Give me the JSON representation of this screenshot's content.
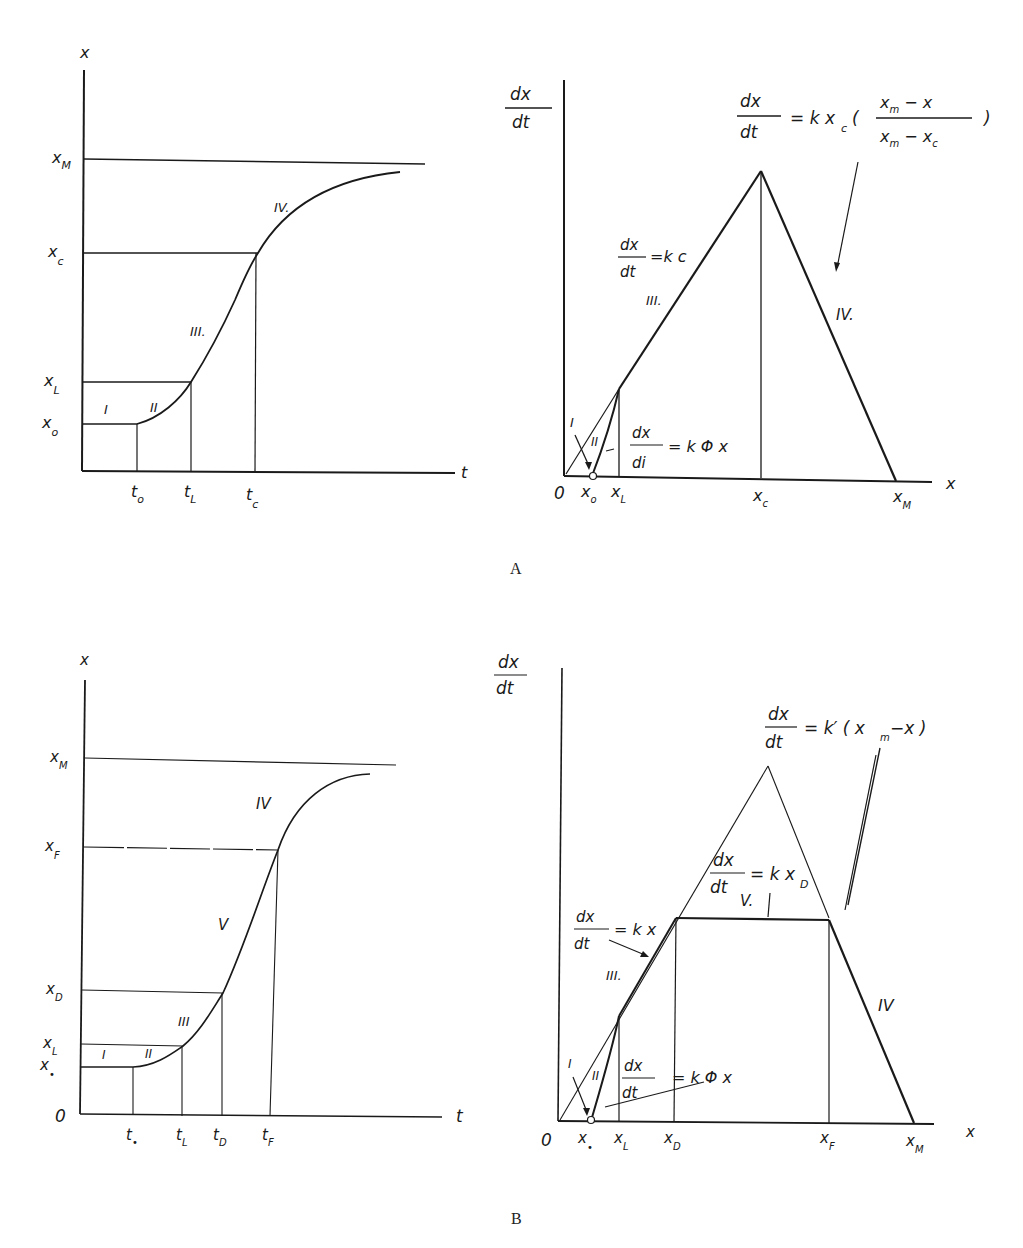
{
  "panels": {
    "A": {
      "caption": "A",
      "left": {
        "y_axis": "x",
        "x_axis": "t",
        "y_ticks": [
          "x_M",
          "x_c",
          "x_L",
          "x_o"
        ],
        "x_ticks": [
          "t_o",
          "t_L",
          "t_c"
        ],
        "phase_labels": [
          "I",
          "II",
          "III.",
          "IV."
        ]
      },
      "right": {
        "y_axis_num": "dx",
        "y_axis_den": "dt",
        "x_axis": "x",
        "x_ticks": [
          "0",
          "x_o",
          "x_L",
          "x_c",
          "x_M"
        ],
        "eq_top": {
          "num": "dx",
          "den": "dt",
          "rhs": "= k x_c (",
          "frac_num": "x_m − x",
          "frac_den": "x_m − x_c",
          "close": ")"
        },
        "eq_III": {
          "num": "dx",
          "den": "dt",
          "rhs": "=k c"
        },
        "eq_II": {
          "num": "dx",
          "den": "di",
          "rhs": "= k Φ x"
        },
        "phase_labels": [
          "I",
          "II",
          "III.",
          "IV."
        ]
      }
    },
    "B": {
      "caption": "B",
      "left": {
        "y_axis": "x",
        "x_axis": "t",
        "origin": "0",
        "y_ticks": [
          "x_M",
          "x_F",
          "x_D",
          "x_L",
          "x_o"
        ],
        "x_ticks": [
          "t_o",
          "t_L",
          "t_D",
          "t_F"
        ],
        "phase_labels": [
          "I",
          "II",
          "III",
          "V",
          "IV"
        ]
      },
      "right": {
        "y_axis_num": "dx",
        "y_axis_den": "dt",
        "x_axis": "x",
        "x_ticks": [
          "0",
          "x_o",
          "x_L",
          "x_D",
          "x_F",
          "x_M"
        ],
        "eq_top": {
          "num": "dx",
          "den": "dt",
          "rhs": "= k′ ( x_m−x )"
        },
        "eq_V": {
          "num": "dx",
          "den": "dt",
          "rhs": "= k x_D"
        },
        "eq_III": {
          "num": "dx",
          "den": "dt",
          "rhs": "= k x"
        },
        "eq_II": {
          "num": "dx",
          "den": "dt",
          "rhs": "= k Φ x"
        },
        "phase_labels": [
          "I",
          "II",
          "III.",
          "V.",
          "IV"
        ]
      }
    }
  }
}
